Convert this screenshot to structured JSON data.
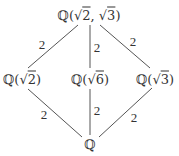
{
  "diagram": {
    "type": "field-extension-lattice",
    "line_color": "#555555",
    "text_color": "#333333",
    "nodes": [
      {
        "id": "top",
        "field": "ℚ",
        "open": "(",
        "rad1": "√",
        "arg1": "2",
        "sep": ", ",
        "rad2": "√",
        "arg2": "3",
        "close": ")",
        "x": 89,
        "y": 15
      },
      {
        "id": "left",
        "field": "ℚ",
        "open": "(",
        "rad1": "√",
        "arg1": "2",
        "close": ")",
        "x": 22,
        "y": 79
      },
      {
        "id": "middle",
        "field": "ℚ",
        "open": "(",
        "rad1": "√",
        "arg1": "6",
        "close": ")",
        "x": 90,
        "y": 79
      },
      {
        "id": "right",
        "field": "ℚ",
        "open": "(",
        "rad1": "√",
        "arg1": "3",
        "close": ")",
        "x": 155,
        "y": 79
      },
      {
        "id": "bottom",
        "field": "ℚ",
        "x": 90,
        "y": 144
      }
    ],
    "edges": [
      {
        "from": "top",
        "to": "left",
        "degree": "2",
        "x1": 78,
        "y1": 25,
        "x2": 28,
        "y2": 68,
        "lx": 42,
        "ly": 44
      },
      {
        "from": "top",
        "to": "middle",
        "degree": "2",
        "x1": 90,
        "y1": 25,
        "x2": 90,
        "y2": 68,
        "lx": 97,
        "ly": 47
      },
      {
        "from": "top",
        "to": "right",
        "degree": "2",
        "x1": 100,
        "y1": 25,
        "x2": 150,
        "y2": 68,
        "lx": 133,
        "ly": 41
      },
      {
        "from": "left",
        "to": "bottom",
        "degree": "2",
        "x1": 28,
        "y1": 89,
        "x2": 82,
        "y2": 137,
        "lx": 44,
        "ly": 114
      },
      {
        "from": "middle",
        "to": "bottom",
        "degree": "2",
        "x1": 90,
        "y1": 89,
        "x2": 90,
        "y2": 135,
        "lx": 97,
        "ly": 110
      },
      {
        "from": "right",
        "to": "bottom",
        "degree": "2",
        "x1": 152,
        "y1": 88,
        "x2": 99,
        "y2": 137,
        "lx": 134,
        "ly": 117
      }
    ]
  }
}
